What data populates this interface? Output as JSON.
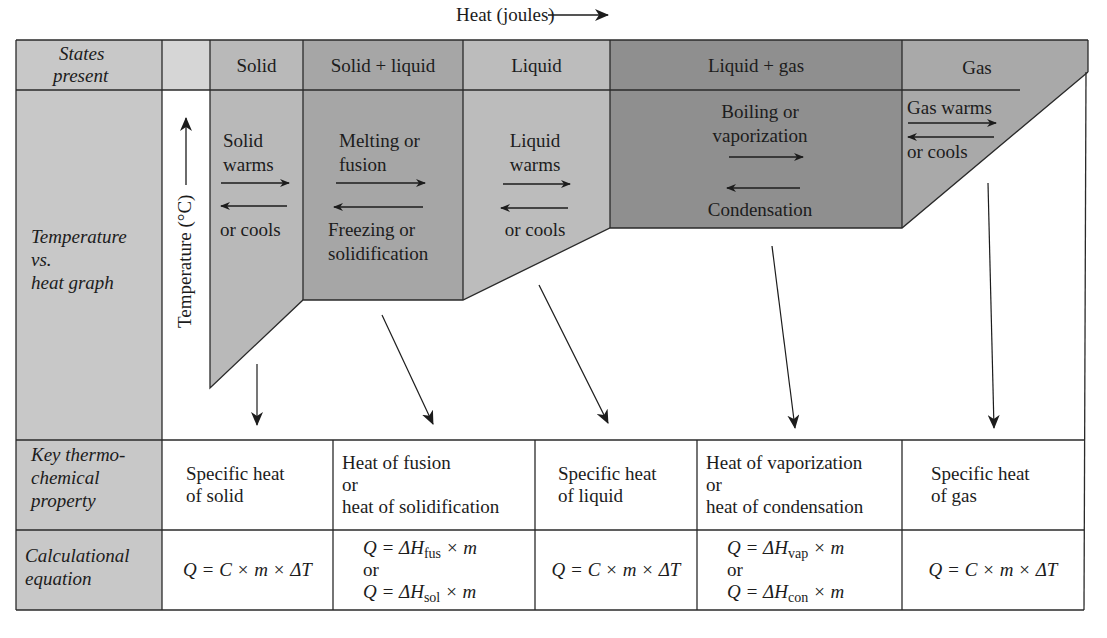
{
  "title": {
    "axis_x_label": "Heat (joules)",
    "axis_y_label": "Temperature (°C)"
  },
  "row_labels": {
    "states": "States present",
    "states_line1": "States",
    "states_line2": "present",
    "graph_line1": "Temperature",
    "graph_line2": "vs.",
    "graph_line3": "heat graph",
    "property_line1": "Key thermo-",
    "property_line2": "chemical",
    "property_line3": "property",
    "equation_line1": "Calculational",
    "equation_line2": "equation"
  },
  "states": [
    {
      "label": "Solid"
    },
    {
      "label": "Solid + liquid"
    },
    {
      "label": "Liquid"
    },
    {
      "label": "Liquid + gas"
    },
    {
      "label": "Gas"
    }
  ],
  "graph_annotations": {
    "solid": {
      "line1": "Solid",
      "line2": "warms",
      "line3": "or cools"
    },
    "solid_liquid": {
      "line1": "Melting or",
      "line2": "fusion",
      "line3": "Freezing or",
      "line4": "solidification"
    },
    "liquid": {
      "line1": "Liquid",
      "line2": "warms",
      "line3": "or cools"
    },
    "liquid_gas": {
      "line1": "Boiling or",
      "line2": "vaporization",
      "line3": "Condensation"
    },
    "gas": {
      "line1": "Gas warms",
      "line2": "or cools"
    }
  },
  "properties": [
    {
      "line1": "Specific heat",
      "line2": "of solid"
    },
    {
      "line1": "Heat of fusion",
      "line2": "or",
      "line3": "heat of solidification"
    },
    {
      "line1": "Specific heat",
      "line2": "of liquid"
    },
    {
      "line1": "Heat of vaporization",
      "line2": "or",
      "line3": "heat of condensation"
    },
    {
      "line1": "Specific heat",
      "line2": "of gas"
    }
  ],
  "equations": [
    {
      "text": "Q = C × m × ΔT"
    },
    {
      "line1_pre": "Q = ΔH",
      "line1_sub": "fus",
      "line1_post": " × m",
      "or": "or",
      "line2_pre": "Q = ΔH",
      "line2_sub": "sol",
      "line2_post": " × m"
    },
    {
      "text": "Q = C × m × ΔT"
    },
    {
      "line1_pre": "Q = ΔH",
      "line1_sub": "vap",
      "line1_post": " × m",
      "or": "or",
      "line2_pre": "Q = ΔH",
      "line2_sub": "con",
      "line2_post": " × m"
    },
    {
      "text": "Q = C × m × ΔT"
    }
  ],
  "colors": {
    "label_fill": "#c8c8c8",
    "solid_fill": "#b9b9b9",
    "solid_liquid_fill": "#a6a6a6",
    "liquid_fill": "#bcbcbc",
    "liquid_gas_fill": "#8f8f8f",
    "gas_fill": "#a9a9a9",
    "line": "#2a2a2a"
  }
}
